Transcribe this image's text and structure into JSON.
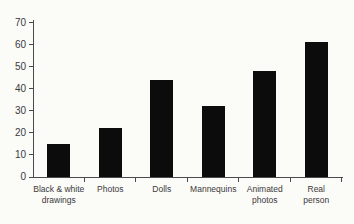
{
  "chart_data": {
    "type": "bar",
    "title": "",
    "xlabel": "",
    "ylabel": "",
    "categories": [
      "Black & white drawings",
      "Photos",
      "Dolls",
      "Mannequins",
      "Animated photos",
      "Real person"
    ],
    "categories_display": [
      "Black & white\ndrawings",
      "Photos",
      "Dolls",
      "Mannequins",
      "Animated\nphotos",
      "Real\nperson"
    ],
    "values": [
      15,
      22,
      44,
      32,
      48,
      61
    ],
    "ylim": [
      0,
      70
    ],
    "yticks": [
      0,
      10,
      20,
      30,
      40,
      50,
      60,
      70
    ],
    "grid": false,
    "legend": false,
    "bar_color": "#0c0c0c",
    "axis_color": "#4a4a4a",
    "text_color": "#3a3a3a",
    "background_color": "#fbfbf8"
  }
}
